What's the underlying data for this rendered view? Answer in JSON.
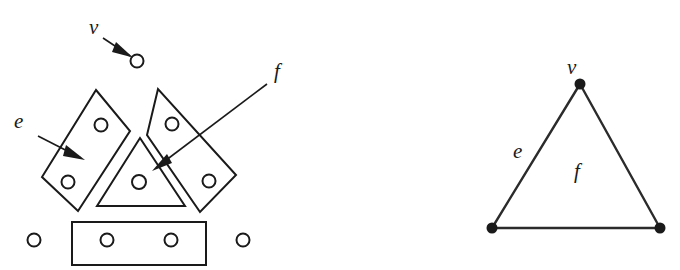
{
  "figure": {
    "background_color": "#ffffff",
    "ink_color": "#1a1a1a",
    "width": 680,
    "height": 270
  },
  "labels": {
    "left_v": "v",
    "left_e": "e",
    "left_f": "f",
    "right_v": "v",
    "right_e": "e",
    "right_f": "f"
  },
  "left_panel": {
    "name": "exploded-complex",
    "description": "Blown-up complex: circles mark vertices, parallelograms and rectangle mark edges, inner triangle marks the face.",
    "vertex_circles": [
      {
        "name": "vertex-top",
        "cx": 137,
        "cy": 61,
        "r": 6.5
      },
      {
        "name": "vertex-edge-left-upper",
        "cx": 101,
        "cy": 125,
        "r": 6.5
      },
      {
        "name": "vertex-edge-left-lower",
        "cx": 68,
        "cy": 182,
        "r": 6.5
      },
      {
        "name": "vertex-edge-right-upper",
        "cx": 172,
        "cy": 124,
        "r": 6.5
      },
      {
        "name": "vertex-edge-right-lower",
        "cx": 209,
        "cy": 181,
        "r": 6.5
      },
      {
        "name": "vertex-face-center",
        "cx": 139,
        "cy": 182,
        "r": 7
      },
      {
        "name": "vertex-bottom-outer-left",
        "cx": 34,
        "cy": 240,
        "r": 6.5
      },
      {
        "name": "vertex-bottom-inner-left",
        "cx": 107,
        "cy": 240,
        "r": 6.5
      },
      {
        "name": "vertex-bottom-inner-right",
        "cx": 171,
        "cy": 240,
        "r": 6.5
      },
      {
        "name": "vertex-bottom-outer-right",
        "cx": 243,
        "cy": 240,
        "r": 6.5
      }
    ],
    "edge_cells": [
      {
        "name": "edge-cell-left",
        "shape": "parallelogram",
        "points": "96,90 130,131 78,211 42,177"
      },
      {
        "name": "edge-cell-right",
        "shape": "parallelogram",
        "points": "158,89 147,135 200,212 236,175"
      },
      {
        "name": "edge-cell-bottom",
        "shape": "rectangle",
        "points": "72,222 206,222 206,265 72,265"
      }
    ],
    "face_cell": {
      "name": "face-cell-triangle",
      "shape": "triangle",
      "points": "140,138 185,206 97,206"
    },
    "annotations": [
      {
        "name": "annotation-v",
        "label_x": 89,
        "label_y": 34,
        "line_from": [
          103,
          38
        ],
        "line_to": [
          131,
          56
        ],
        "arrow_at": [
          133,
          57
        ],
        "arrow_angle_deg": 33
      },
      {
        "name": "annotation-e",
        "label_x": 14,
        "label_y": 128,
        "line_from": [
          38,
          136
        ],
        "line_to": [
          82,
          158
        ],
        "arrow_at": [
          84,
          159
        ],
        "arrow_angle_deg": 27
      },
      {
        "name": "annotation-f",
        "label_x": 274,
        "label_y": 78,
        "line_from": [
          267,
          84
        ],
        "line_to": [
          156,
          168
        ],
        "arrow_at": [
          153,
          171
        ],
        "arrow_angle_deg": 217
      }
    ]
  },
  "right_panel": {
    "name": "collapsed-triangle",
    "description": "The same complex collapsed: a solid triangle with three vertex dots.",
    "vertices": [
      {
        "name": "triangle-apex",
        "x": 580,
        "y": 84,
        "r": 5.5
      },
      {
        "name": "triangle-bottom-left",
        "x": 492,
        "y": 228,
        "r": 5.5
      },
      {
        "name": "triangle-bottom-right",
        "x": 660,
        "y": 228,
        "r": 5.5
      }
    ],
    "edges": [
      {
        "name": "triangle-edge-left",
        "from": [
          580,
          84
        ],
        "to": [
          492,
          228
        ]
      },
      {
        "name": "triangle-edge-right",
        "from": [
          580,
          84
        ],
        "to": [
          660,
          228
        ]
      },
      {
        "name": "triangle-edge-bottom",
        "from": [
          492,
          228
        ],
        "to": [
          660,
          228
        ]
      }
    ],
    "label_positions": {
      "v": {
        "x": 567,
        "y": 74
      },
      "e": {
        "x": 513,
        "y": 158
      },
      "f": {
        "x": 574,
        "y": 178
      }
    }
  }
}
